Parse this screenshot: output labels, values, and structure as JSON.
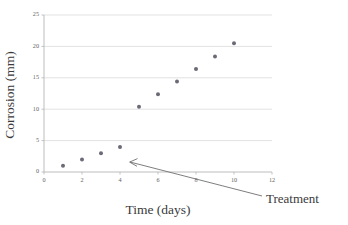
{
  "chart_data": {
    "type": "scatter",
    "title": "",
    "xlabel": "Time (days)",
    "ylabel": "Corrosion (mm)",
    "xlim": [
      0,
      12
    ],
    "ylim": [
      0,
      25
    ],
    "xticks": [
      0,
      2,
      4,
      6,
      8,
      10,
      12
    ],
    "yticks": [
      0,
      5,
      10,
      15,
      20,
      25
    ],
    "xtick_labels": [
      "0",
      "2",
      "4",
      "6",
      "8",
      "10",
      "12"
    ],
    "ytick_labels": [
      "0",
      "5",
      "10",
      "15",
      "20",
      "25"
    ],
    "grid": "horizontal",
    "legend": "none",
    "series": [
      {
        "name": "Corrosion",
        "marker": "circle",
        "color": "#6b6b78",
        "x": [
          1,
          2,
          3,
          4,
          5,
          6,
          7,
          8,
          9,
          10
        ],
        "values": [
          1.0,
          2.0,
          3.0,
          4.0,
          10.4,
          12.4,
          14.4,
          16.4,
          18.4,
          20.5
        ]
      }
    ],
    "annotations": [
      {
        "text": "Treatment",
        "arrow_target_x": 4.5,
        "arrow_target_y": 4.7,
        "label_x": 10.6,
        "label_y": -3.4
      }
    ]
  },
  "axes": {
    "y_title": "Corrosion (mm)",
    "x_title": "Time (days)"
  },
  "annotation": {
    "treatment_label": "Treatment"
  },
  "colors": {
    "marker": "#6b6b78",
    "grid": "#d6d6d6",
    "axis": "#b5b5b5",
    "text": "#3a3a3a",
    "tick_text": "#5f5f5f",
    "annotation": "#6f6f6f"
  }
}
